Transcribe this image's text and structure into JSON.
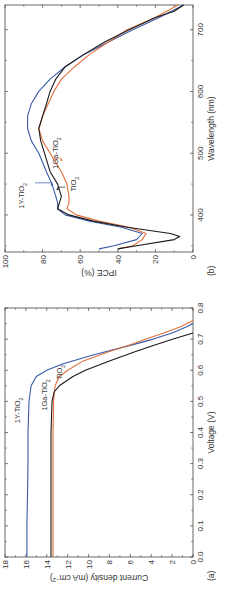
{
  "figure": {
    "rotation_deg": 90,
    "panel_a_label": "(a)",
    "panel_b_label": "(b)"
  },
  "chart_data": [
    {
      "panel": "(a)",
      "type": "line",
      "title": "",
      "xlabel": "Voltage (V)",
      "ylabel": "Current density (mA cm^-2)",
      "xlim": [
        0.0,
        0.8
      ],
      "ylim": [
        0,
        18
      ],
      "xticks": [
        "0.0",
        "0.1",
        "0.2",
        "0.3",
        "0.4",
        "0.5",
        "0.6",
        "0.7",
        "0.8"
      ],
      "yticks": [
        "0",
        "2",
        "4",
        "6",
        "8",
        "10",
        "12",
        "14",
        "16",
        "18"
      ],
      "series": [
        {
          "name": "1Y-TiO2",
          "color": "#3a5aa8",
          "x": [
            0.0,
            0.1,
            0.2,
            0.3,
            0.4,
            0.5,
            0.55,
            0.58,
            0.6,
            0.62,
            0.65,
            0.68,
            0.7,
            0.72,
            0.74,
            0.75
          ],
          "y": [
            15.9,
            15.9,
            15.85,
            15.8,
            15.8,
            15.7,
            15.5,
            15.0,
            14.0,
            12.5,
            9.5,
            6.0,
            3.8,
            2.0,
            0.6,
            0.0
          ]
        },
        {
          "name": "1Ga-TiO2",
          "color": "#e0703a",
          "x": [
            0.0,
            0.1,
            0.2,
            0.3,
            0.4,
            0.5,
            0.55,
            0.58,
            0.6,
            0.63,
            0.66,
            0.68,
            0.7,
            0.72,
            0.74,
            0.76
          ],
          "y": [
            13.4,
            13.4,
            13.4,
            13.4,
            13.4,
            13.35,
            13.2,
            12.8,
            12.0,
            10.5,
            8.0,
            6.2,
            4.5,
            2.8,
            1.2,
            0.0
          ]
        },
        {
          "name": "TiO2",
          "color": "#1a1a1a",
          "x": [
            0.0,
            0.1,
            0.2,
            0.3,
            0.4,
            0.5,
            0.53,
            0.55,
            0.58,
            0.6,
            0.63,
            0.66,
            0.68,
            0.7,
            0.72
          ],
          "y": [
            13.6,
            13.6,
            13.6,
            13.6,
            13.6,
            13.5,
            13.3,
            12.8,
            11.5,
            10.3,
            8.0,
            5.5,
            3.8,
            1.9,
            0.0
          ]
        }
      ],
      "annotations": [
        "1Y-TiO2",
        "1Ga-TiO2",
        "TiO2"
      ],
      "legend": "inline labels",
      "grid": false
    },
    {
      "panel": "(b)",
      "type": "line",
      "title": "",
      "xlabel": "Wavelength (nm)",
      "ylabel": "IPCE (%)",
      "xlim": [
        340,
        740
      ],
      "ylim": [
        0,
        100
      ],
      "xticks": [
        "400",
        "500",
        "600",
        "700"
      ],
      "yticks": [
        "0",
        "20",
        "40",
        "60",
        "80",
        "100"
      ],
      "series": [
        {
          "name": "1Y-TiO2",
          "color": "#3a5aa8",
          "x": [
            345,
            350,
            360,
            370,
            380,
            390,
            400,
            410,
            420,
            430,
            450,
            470,
            500,
            520,
            540,
            560,
            580,
            600,
            620,
            640,
            660,
            680,
            700,
            720,
            740
          ],
          "y": [
            50,
            42,
            30,
            27,
            38,
            55,
            68,
            72,
            72,
            73,
            75,
            78,
            82,
            86,
            88,
            88,
            86,
            82,
            76,
            68,
            58,
            45,
            32,
            18,
            5
          ]
        },
        {
          "name": "1Ga-TiO2",
          "color": "#e0703a",
          "x": [
            345,
            350,
            360,
            370,
            380,
            390,
            400,
            410,
            420,
            430,
            450,
            470,
            500,
            520,
            540,
            560,
            580,
            600,
            620,
            640,
            660,
            680,
            700,
            720,
            740
          ],
          "y": [
            40,
            32,
            27,
            25,
            34,
            50,
            62,
            67,
            66,
            66,
            67,
            70,
            76,
            80,
            82,
            80,
            77,
            74,
            70,
            63,
            55,
            45,
            35,
            20,
            8
          ]
        },
        {
          "name": "TiO2",
          "color": "#1a1a1a",
          "x": [
            345,
            350,
            360,
            365,
            370,
            380,
            390,
            400,
            410,
            420,
            430,
            450,
            470,
            500,
            520,
            540,
            560,
            580,
            600,
            620,
            640,
            660,
            680,
            700,
            720,
            730,
            740
          ],
          "y": [
            40,
            30,
            10,
            7,
            12,
            35,
            53,
            66,
            72,
            71,
            70,
            72,
            76,
            79,
            81,
            82,
            80,
            78,
            76,
            73,
            68,
            58,
            47,
            34,
            20,
            10,
            5
          ]
        }
      ],
      "annotations": [
        "1Y-TiO2",
        "1Ga-TiO2",
        "TiO2"
      ],
      "legend": "inline labels with arrows",
      "grid": false
    }
  ]
}
